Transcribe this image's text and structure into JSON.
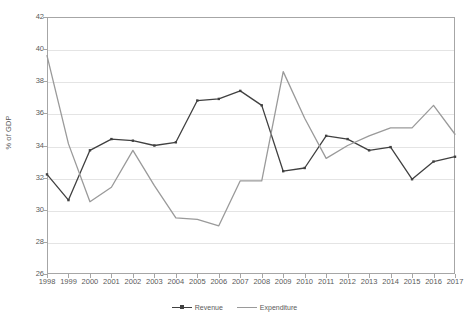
{
  "chart_data": {
    "type": "line",
    "title": "",
    "xlabel": "",
    "ylabel": "% of GDP",
    "ylim": [
      26,
      42
    ],
    "ytick_step": 2,
    "yticks": [
      42,
      40,
      38,
      36,
      34,
      32,
      30,
      28,
      26
    ],
    "grid": true,
    "legend_position": "bottom",
    "categories": [
      "1998",
      "1999",
      "2000",
      "2001",
      "2002",
      "2003",
      "2004",
      "2005",
      "2006",
      "2007",
      "2008",
      "2009",
      "2010",
      "2011",
      "2012",
      "2013",
      "2014",
      "2015",
      "2016",
      "2017"
    ],
    "series": [
      {
        "name": "Revenue",
        "color": "#404040",
        "marker": true,
        "values": [
          32.2,
          30.6,
          33.7,
          34.4,
          34.3,
          34.0,
          34.2,
          36.8,
          36.9,
          37.4,
          36.5,
          32.4,
          32.6,
          34.6,
          34.4,
          33.7,
          33.9,
          31.9,
          33.0,
          33.3
        ]
      },
      {
        "name": "Expenditure",
        "color": "#9a9a9a",
        "marker": false,
        "values": [
          39.6,
          34.1,
          30.5,
          31.4,
          33.7,
          31.5,
          29.5,
          29.4,
          29.0,
          31.8,
          31.8,
          38.6,
          35.7,
          33.2,
          34.0,
          34.6,
          35.1,
          35.1,
          36.5,
          34.7
        ]
      }
    ]
  },
  "legend": {
    "items": [
      {
        "label": "Revenue"
      },
      {
        "label": "Expenditure"
      }
    ]
  },
  "axes": {
    "y_axis_title": "% of GDP"
  }
}
